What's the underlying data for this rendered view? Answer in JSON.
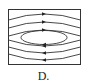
{
  "figure": {
    "label": "D.",
    "line_color": "#333333",
    "background": "#ffffff",
    "upper_lines": 3,
    "lower_lines": 3,
    "center_ellipse": 1
  }
}
